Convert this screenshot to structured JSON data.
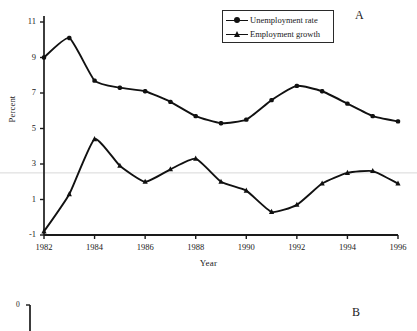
{
  "figure": {
    "panel_a_tag": "A",
    "panel_b_tag": "B"
  },
  "chart_data": {
    "type": "line",
    "title": "",
    "xlabel": "Year",
    "ylabel": "Percent",
    "x": [
      1982,
      1983,
      1984,
      1985,
      1986,
      1987,
      1988,
      1989,
      1990,
      1991,
      1992,
      1993,
      1994,
      1995,
      1996
    ],
    "xlim": [
      1982,
      1996
    ],
    "ylim": [
      -1,
      11
    ],
    "xticks": [
      1982,
      1984,
      1986,
      1988,
      1990,
      1992,
      1994,
      1996
    ],
    "xticklabels": [
      "1982",
      "1984",
      "1986",
      "1988",
      "1990",
      "1992",
      "1994",
      "1996"
    ],
    "yticks": [
      -1,
      1,
      3,
      5,
      7,
      9,
      11
    ],
    "yticklabels": [
      "-1",
      "1",
      "3",
      "5",
      "7",
      "9",
      "11"
    ],
    "grid": "single faint horizontal rule near y=2.5",
    "legend_position": "top-right inside axes",
    "series": [
      {
        "name": "Unemployment rate",
        "marker": "circle",
        "color": "#111111",
        "values": [
          9.0,
          10.1,
          7.7,
          7.3,
          7.1,
          6.5,
          5.7,
          5.3,
          5.5,
          6.6,
          7.4,
          7.1,
          6.4,
          5.7,
          5.4
        ]
      },
      {
        "name": "Employment growth",
        "marker": "triangle",
        "color": "#111111",
        "values": [
          -0.8,
          1.3,
          4.4,
          2.9,
          2.0,
          2.7,
          3.3,
          2.0,
          1.5,
          0.3,
          0.7,
          1.9,
          2.5,
          2.6,
          1.9
        ]
      }
    ]
  },
  "panel_b": {
    "ytick_top": "0"
  },
  "colors": {
    "line": "#111111",
    "axis": "#1a1a1a",
    "gridline": "#d8d8d8",
    "background": "#ffffff"
  }
}
